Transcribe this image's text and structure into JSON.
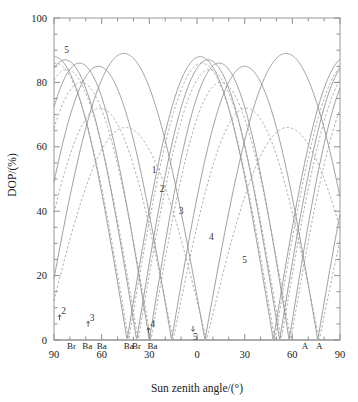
{
  "chart_data": {
    "type": "line",
    "title": "",
    "xlabel": "Sun zenith angle/(°)",
    "ylabel": "DOP/(%)",
    "xlim": [
      -90,
      90
    ],
    "ylim": [
      0,
      100
    ],
    "xticks": [
      -90,
      -60,
      -30,
      0,
      30,
      60,
      90
    ],
    "xticklabels": [
      "90",
      "60",
      "30",
      "0",
      "30",
      "60",
      "90"
    ],
    "yticks": [
      0,
      20,
      40,
      60,
      80,
      100
    ],
    "yticklabels": [
      "0",
      "20",
      "40",
      "60",
      "80",
      "100"
    ],
    "xminor_step": 10,
    "yminor_step": 5,
    "grid": false,
    "legend": "none",
    "series": [
      {
        "name": "1",
        "style": "solid",
        "peak_dop": 88,
        "peak_x": 2,
        "zero_x": -44
      },
      {
        "name": "1d",
        "style": "dashed",
        "peak_dop": 86,
        "peak_x": 3,
        "zero_x": -43
      },
      {
        "name": "2",
        "style": "solid",
        "peak_dop": 87,
        "peak_x": 7,
        "zero_x": -38
      },
      {
        "name": "2d",
        "style": "dashed",
        "peak_dop": 84,
        "peak_x": 8,
        "zero_x": -37
      },
      {
        "name": "3",
        "style": "solid",
        "peak_dop": 86,
        "peak_x": 14,
        "zero_x": -30
      },
      {
        "name": "3d",
        "style": "dashed",
        "peak_dop": 80,
        "peak_x": 15,
        "zero_x": -29
      },
      {
        "name": "4",
        "style": "solid",
        "peak_dop": 85,
        "peak_x": 30,
        "zero_x": -16
      },
      {
        "name": "4d",
        "style": "dashed",
        "peak_dop": 72,
        "peak_x": 31,
        "zero_x": -15
      },
      {
        "name": "5",
        "style": "solid",
        "peak_dop": 89,
        "peak_x": 56,
        "zero_x": 5
      },
      {
        "name": "5d",
        "style": "dashed",
        "peak_dop": 66,
        "peak_x": 57,
        "zero_x": 6
      }
    ],
    "curve_labels": [
      {
        "text": "1",
        "x": -27,
        "y": 52
      },
      {
        "text": "2",
        "x": -22,
        "y": 46
      },
      {
        "text": "3",
        "x": -10,
        "y": 39
      },
      {
        "text": "4",
        "x": 9,
        "y": 31
      },
      {
        "text": "5",
        "x": 30,
        "y": 24
      },
      {
        "text": "5",
        "x": -82,
        "y": 89
      },
      {
        "text": "2",
        "x": -84,
        "y": 8
      },
      {
        "text": "3",
        "x": -66,
        "y": 6
      },
      {
        "text": "4",
        "x": -28,
        "y": 4
      },
      {
        "text": "5",
        "x": -1,
        "y": 0
      }
    ],
    "neutral_points": [
      {
        "label": "Br",
        "x": -79
      },
      {
        "label": "Ba",
        "x": -69
      },
      {
        "label": "Ba",
        "x": -60
      },
      {
        "label": "Ba",
        "x": -43
      },
      {
        "label": "Br",
        "x": -38
      },
      {
        "label": "Ba",
        "x": -28
      },
      {
        "label": "A",
        "x": 68
      },
      {
        "label": "A",
        "x": 77
      }
    ]
  },
  "axes": {
    "x_title": "Sun zenith angle/(°)",
    "y_title": "DOP/(%)"
  },
  "colors": {
    "frame": "#9a9a9a",
    "curve_solid": "#8c8c8c",
    "curve_dashed": "#9e9e9e",
    "text": "#1a1a1a",
    "background": "#ffffff"
  }
}
